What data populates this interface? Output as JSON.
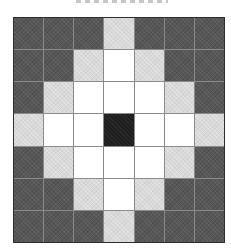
{
  "figure": {
    "background_color": "#ffffff"
  },
  "chart_data": {
    "type": "heatmap",
    "title": "",
    "rows": 7,
    "cols": 7,
    "grid": [
      [
        "dark",
        "dark",
        "dark",
        "light",
        "dark",
        "dark",
        "dark"
      ],
      [
        "dark",
        "dark",
        "light",
        "white",
        "light",
        "dark",
        "dark"
      ],
      [
        "dark",
        "light",
        "white",
        "white",
        "white",
        "light",
        "dark"
      ],
      [
        "light",
        "white",
        "white",
        "black",
        "white",
        "white",
        "light"
      ],
      [
        "dark",
        "light",
        "white",
        "white",
        "white",
        "light",
        "dark"
      ],
      [
        "dark",
        "dark",
        "light",
        "white",
        "light",
        "dark",
        "dark"
      ],
      [
        "dark",
        "dark",
        "dark",
        "light",
        "dark",
        "dark",
        "dark"
      ]
    ],
    "palette": {
      "black": "#1f1f1f",
      "white": "#ffffff",
      "light": "#d9d9d9",
      "dark": "#575757"
    },
    "gridlines": {
      "interior_color": "#8a8a8a",
      "outer_border_color": "#2e2e2e"
    },
    "legend": "none",
    "axis_labels": "none"
  }
}
